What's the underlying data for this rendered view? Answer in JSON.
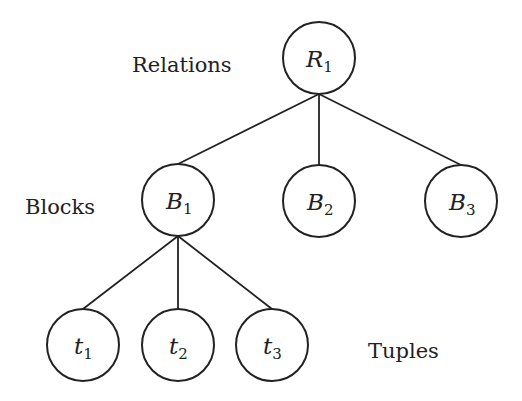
{
  "diagram": {
    "type": "tree",
    "level_labels": {
      "relations": "Relations",
      "blocks": "Blocks",
      "tuples": "Tuples"
    },
    "nodes": [
      {
        "id": "R1",
        "letter": "R",
        "sub": "1",
        "level": "relations",
        "cx": 319,
        "cy": 58
      },
      {
        "id": "B1",
        "letter": "B",
        "sub": "1",
        "level": "blocks",
        "cx": 178,
        "cy": 200
      },
      {
        "id": "B2",
        "letter": "B",
        "sub": "2",
        "level": "blocks",
        "cx": 319,
        "cy": 201
      },
      {
        "id": "B3",
        "letter": "B",
        "sub": "3",
        "level": "blocks",
        "cx": 461,
        "cy": 201
      },
      {
        "id": "t1",
        "letter": "t",
        "sub": "1",
        "level": "tuples",
        "cx": 83,
        "cy": 345
      },
      {
        "id": "t2",
        "letter": "t",
        "sub": "2",
        "level": "tuples",
        "cx": 178,
        "cy": 345
      },
      {
        "id": "t3",
        "letter": "t",
        "sub": "3",
        "level": "tuples",
        "cx": 272,
        "cy": 345
      }
    ],
    "edges": [
      [
        "R1",
        "B1"
      ],
      [
        "R1",
        "B2"
      ],
      [
        "R1",
        "B3"
      ],
      [
        "B1",
        "t1"
      ],
      [
        "B1",
        "t2"
      ],
      [
        "B1",
        "t3"
      ]
    ],
    "radius": 36,
    "stroke_color": "#222222"
  }
}
